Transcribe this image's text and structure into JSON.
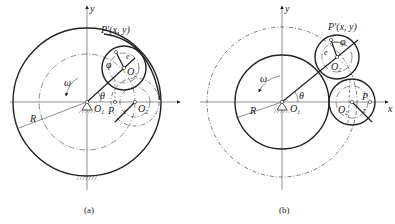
{
  "figure_a": {
    "caption": "(a)",
    "labels": {
      "y_axis": "y",
      "point_p_prime": "P′(x, y)",
      "e": "e",
      "phi": "φ",
      "o2_prime": "O",
      "o2_prime_sub": "2",
      "o2_prime_mark": "′",
      "omega": "ω",
      "theta": "θ",
      "o1": "O",
      "o1_sub": "1",
      "p": "P",
      "r": "r",
      "o2": "O",
      "o2_sub": "2",
      "R": "R"
    }
  },
  "figure_b": {
    "caption": "(b)",
    "labels": {
      "y_axis": "y",
      "x_axis": "x",
      "point_p_prime": "P′(x, y)",
      "e": "e",
      "phi": "φ",
      "o2_prime": "O",
      "o2_prime_sub": "2",
      "o2_prime_mark": "′",
      "omega": "ω",
      "theta": "θ",
      "o1": "O",
      "o1_sub": "1",
      "p": "P",
      "r": "r",
      "o2": "O",
      "o2_sub": "2",
      "R": "R"
    }
  }
}
